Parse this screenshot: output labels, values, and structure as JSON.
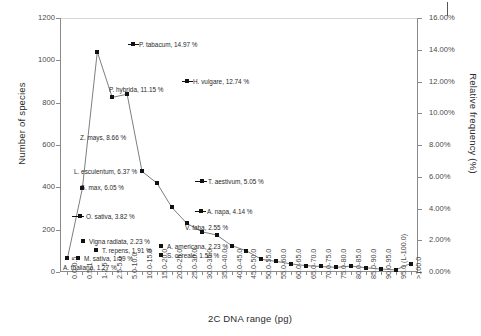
{
  "chart_data": {
    "type": "line",
    "title": "",
    "xlabel": "2C DNA range (pg)",
    "ylabel": "Number of species",
    "ylabel_right": "Relative frequency (%)",
    "ylim": [
      0,
      1200
    ],
    "yticks": [
      0,
      200,
      400,
      600,
      800,
      1000,
      1200
    ],
    "ylim_right": [
      0,
      16
    ],
    "yticks_right": [
      "0.00%",
      "2.00%",
      "4.00%",
      "6.00%",
      "8.00%",
      "10.00%",
      "12.00%",
      "14.00%",
      "16.00%"
    ],
    "grid": false,
    "legend": "none",
    "categories": [
      "0.0-0.5",
      "0.5-1",
      "1-2.5",
      "2.5-5.0",
      "5.0-10.0",
      "10.0-15.0",
      "15.0-20.0",
      "20.0-25.0",
      "25.0-30.0",
      "30.0-35.0",
      "35.0-40.0",
      "40.0-45.0",
      "45.0-50.0",
      "50.0-55.0",
      "55.0-60.0",
      "60.0-65.0",
      "65.0-70.0",
      "70.0-75.0",
      "75.0-80.0",
      "80.0-85.0",
      "85.0-90.0",
      "90.0-95.0",
      "95.0 (L-100.0)",
      ">100.0"
    ],
    "values": [
      65,
      395,
      1040,
      825,
      840,
      475,
      420,
      305,
      230,
      190,
      175,
      125,
      100,
      60,
      50,
      38,
      30,
      26,
      22,
      28,
      20,
      14,
      10,
      40
    ]
  },
  "annotations": [
    {
      "id": "ann-ptabacum",
      "text": "P. tabacum, 14.97 %",
      "x": 139,
      "y": 41,
      "marker": 133,
      "bar": [
        128,
        11
      ]
    },
    {
      "id": "ann-hvulgare",
      "text": "H. vulgare, 12.74 %",
      "x": 193,
      "y": 78,
      "marker": 187,
      "bar": [
        182,
        11
      ]
    },
    {
      "id": "ann-phybrida",
      "text": "P. hybrida, 11.15 %",
      "x": 109,
      "y": 86,
      "marker": null,
      "bar": null
    },
    {
      "id": "ann-zmays",
      "text": "Z. mays, 8.66 %",
      "x": 80,
      "y": 134,
      "marker": null,
      "bar": null
    },
    {
      "id": "ann-lesculentum",
      "text": "L. esculentum, 6.37 %",
      "x": 74,
      "y": 168,
      "marker": null,
      "bar": null
    },
    {
      "id": "ann-gmax",
      "text": "G. max, 6.05 %",
      "x": 80,
      "y": 184,
      "marker": null,
      "bar": null
    },
    {
      "id": "ann-taestivum",
      "text": "T. aestivum, 5.05 %",
      "x": 208,
      "y": 178,
      "marker": 202,
      "bar": [
        195,
        12
      ]
    },
    {
      "id": "ann-osativa",
      "text": "O. sativa, 3.82 %",
      "x": 86,
      "y": 213,
      "marker": 80,
      "bar": [
        72,
        12
      ]
    },
    {
      "id": "ann-bnapa",
      "text": "A. napa, 4.14 %",
      "x": 207,
      "y": 208,
      "marker": 201,
      "bar": [
        195,
        11
      ]
    },
    {
      "id": "ann-vfaba",
      "text": "V. faba, 2.55 %",
      "x": 185,
      "y": 224,
      "marker": null,
      "bar": null
    },
    {
      "id": "ann-vignaradiata",
      "text": "Vigna radiata, 2.23 %",
      "x": 89,
      "y": 238,
      "marker": 83,
      "bar": null
    },
    {
      "id": "ann-aamericana",
      "text": "A. americana, 2.23 %",
      "x": 167,
      "y": 243,
      "marker": 161,
      "bar": null
    },
    {
      "id": "ann-trepens",
      "text": "T. repens, 1.91 %",
      "x": 102,
      "y": 247,
      "marker": 96,
      "bar": null
    },
    {
      "id": "ann-scereale",
      "text": "S. cereale, 1.59 %",
      "x": 167,
      "y": 252,
      "marker": 161,
      "bar": null
    },
    {
      "id": "ann-msativa",
      "text": "M. sativa, 1.59 %",
      "x": 84,
      "y": 255,
      "marker": 78,
      "bar": null
    },
    {
      "id": "ann-athaliana",
      "text": "A. thaliana, 1.27 %",
      "x": 63,
      "y": 264,
      "marker": null,
      "bar": null
    }
  ]
}
